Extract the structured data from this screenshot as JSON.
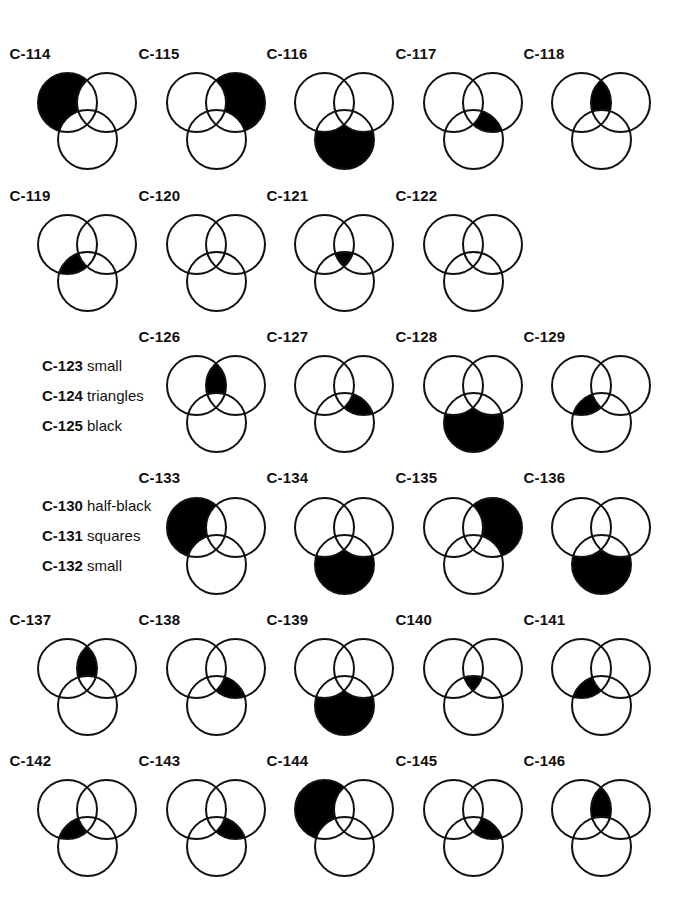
{
  "geometry": {
    "radius": 29.5,
    "offset_B": [
      39,
      0
    ],
    "offset_C": [
      20,
      37
    ],
    "stroke_color": "#111111",
    "fill_color": "#000000",
    "stroke_width": 2
  },
  "columns_x": [
    67,
    196,
    324,
    453,
    581
  ],
  "rows": [
    {
      "center_y": 102,
      "label_top": 45
    },
    {
      "center_y": 244,
      "label_top": 187
    },
    {
      "center_y": 385,
      "label_top": 328
    },
    {
      "center_y": 527,
      "label_top": 469
    },
    {
      "center_y": 668,
      "label_top": 611
    },
    {
      "center_y": 809,
      "label_top": 752
    }
  ],
  "diagrams": [
    {
      "label": "C-114",
      "row": 0,
      "col": 0,
      "shaded": "A-only"
    },
    {
      "label": "C-115",
      "row": 0,
      "col": 1,
      "shaded": "B-only"
    },
    {
      "label": "C-116",
      "row": 0,
      "col": 2,
      "shaded": "C-only"
    },
    {
      "label": "C-117",
      "row": 0,
      "col": 3,
      "shaded": "BC-not-A"
    },
    {
      "label": "C-118",
      "row": 0,
      "col": 4,
      "shaded": "AB-not-C"
    },
    {
      "label": "C-119",
      "row": 1,
      "col": 0,
      "shaded": "AC-not-B"
    },
    {
      "label": "C-120",
      "row": 1,
      "col": 1,
      "shaded": "none"
    },
    {
      "label": "C-121",
      "row": 1,
      "col": 2,
      "shaded": "ABC"
    },
    {
      "label": "C-122",
      "row": 1,
      "col": 3,
      "shaded": "none"
    },
    {
      "label": "C-126",
      "row": 2,
      "col": 1,
      "shaded": "AB-not-C"
    },
    {
      "label": "C-127",
      "row": 2,
      "col": 2,
      "shaded": "BC-not-A"
    },
    {
      "label": "C-128",
      "row": 2,
      "col": 3,
      "shaded": "C-only"
    },
    {
      "label": "C-129",
      "row": 2,
      "col": 4,
      "shaded": "AC-not-B"
    },
    {
      "label": "C-133",
      "row": 3,
      "col": 1,
      "shaded": "A-only"
    },
    {
      "label": "C-134",
      "row": 3,
      "col": 2,
      "shaded": "C-only"
    },
    {
      "label": "C-135",
      "row": 3,
      "col": 3,
      "shaded": "B-only"
    },
    {
      "label": "C-136",
      "row": 3,
      "col": 4,
      "shaded": "C-only"
    },
    {
      "label": "C-137",
      "row": 4,
      "col": 0,
      "shaded": "AB-not-C"
    },
    {
      "label": "C-138",
      "row": 4,
      "col": 1,
      "shaded": "BC-not-A"
    },
    {
      "label": "C-139",
      "row": 4,
      "col": 2,
      "shaded": "C-only"
    },
    {
      "label": "C140",
      "row": 4,
      "col": 3,
      "shaded": "ABC"
    },
    {
      "label": "C-141",
      "row": 4,
      "col": 4,
      "shaded": "AC-not-B"
    },
    {
      "label": "C-142",
      "row": 5,
      "col": 0,
      "shaded": "AC-not-B"
    },
    {
      "label": "C-143",
      "row": 5,
      "col": 1,
      "shaded": "BC-not-A"
    },
    {
      "label": "C-144",
      "row": 5,
      "col": 2,
      "shaded": "A-only"
    },
    {
      "label": "C-145",
      "row": 5,
      "col": 3,
      "shaded": "BC-not-A"
    },
    {
      "label": "C-146",
      "row": 5,
      "col": 4,
      "shaded": "AB-not-C"
    }
  ],
  "side_notes": [
    {
      "code": "C-123",
      "text": "small",
      "x": 42,
      "y": 357
    },
    {
      "code": "C-124",
      "text": "triangles",
      "x": 42,
      "y": 387
    },
    {
      "code": "C-125",
      "text": "black",
      "x": 42,
      "y": 417
    },
    {
      "code": "C-130",
      "text": "half-black",
      "x": 42,
      "y": 497
    },
    {
      "code": "C-131",
      "text": "squares",
      "x": 42,
      "y": 527
    },
    {
      "code": "C-132",
      "text": "small",
      "x": 42,
      "y": 557
    }
  ]
}
